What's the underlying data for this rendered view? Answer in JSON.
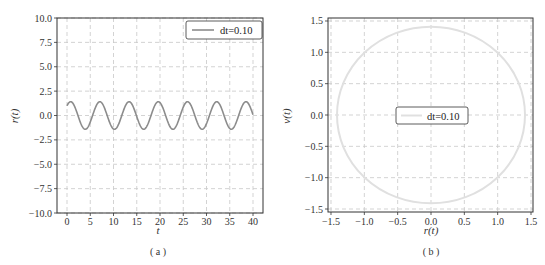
{
  "chart_data": [
    {
      "type": "line",
      "panel": "(a)",
      "title": "",
      "xlabel": "t",
      "ylabel": "r(t)",
      "xlim": [
        -1,
        41
      ],
      "ylim": [
        -10,
        10
      ],
      "xticks": [
        "0",
        "5",
        "10",
        "15",
        "20",
        "25",
        "30",
        "35",
        "40"
      ],
      "yticks": [
        "10.0",
        "7.5",
        "5.0",
        "2.5",
        "0.0",
        "−2.5",
        "−5.0",
        "−7.5",
        "−10.0"
      ],
      "grid": true,
      "legend": {
        "position": "upper right",
        "entries": [
          "dt=0.10"
        ]
      },
      "series": [
        {
          "name": "dt=0.10",
          "color": "#8c8c8c",
          "function": "r(t)=cos(t)+sin(t)",
          "amplitude": 1.41,
          "period": 6.28,
          "t_range": [
            0,
            40
          ],
          "r_at_t0": 1.0
        }
      ]
    },
    {
      "type": "line",
      "panel": "(b)",
      "title": "",
      "xlabel": "r(t)",
      "ylabel": "v(t)",
      "xlim": [
        -1.55,
        1.55
      ],
      "ylim": [
        -1.55,
        1.55
      ],
      "xticks": [
        "−1.5",
        "−1.0",
        "−0.5",
        "0.0",
        "0.5",
        "1.0",
        "1.5"
      ],
      "yticks": [
        "1.5",
        "1.0",
        "0.5",
        "0.0",
        "−0.5",
        "−1.0",
        "−1.5"
      ],
      "grid": true,
      "legend": {
        "position": "center",
        "entries": [
          "dt=0.10"
        ]
      },
      "series": [
        {
          "name": "dt=0.10",
          "color": "#e0e0e0",
          "shape": "circle",
          "radius": 1.41,
          "center": [
            0,
            0
          ]
        }
      ]
    }
  ],
  "panel_a": {
    "caption": "( a )",
    "xlabel": "t",
    "ylabel": "r(t)",
    "legend_label": "dt=0.10",
    "xticks": [
      "0",
      "5",
      "10",
      "15",
      "20",
      "25",
      "30",
      "35",
      "40"
    ],
    "yticks": [
      "10.0",
      "7.5",
      "5.0",
      "2.5",
      "0.0",
      "−2.5",
      "−5.0",
      "−7.5",
      "−10.0"
    ]
  },
  "panel_b": {
    "caption": "( b )",
    "xlabel": "r(t)",
    "ylabel": "v(t)",
    "legend_label": "dt=0.10",
    "xticks": [
      "−1.5",
      "−1.0",
      "−0.5",
      "0.0",
      "0.5",
      "1.0",
      "1.5"
    ],
    "yticks": [
      "1.5",
      "1.0",
      "0.5",
      "0.0",
      "−0.5",
      "−1.0",
      "−1.5"
    ]
  }
}
